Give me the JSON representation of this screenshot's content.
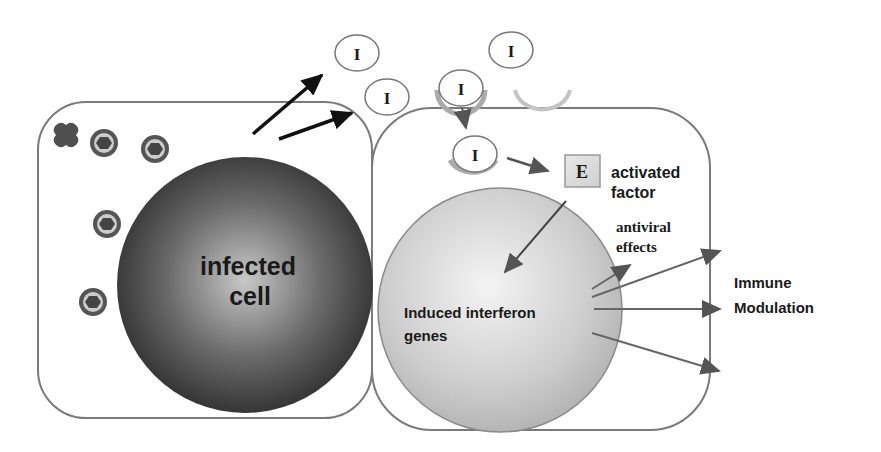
{
  "diagram": {
    "infected_cell": {
      "line1": "infected",
      "line2": "cell"
    },
    "induced_genes": {
      "line1": "Induced interferon",
      "line2": "genes"
    },
    "activated_factor": {
      "symbol": "E",
      "line1": "activated",
      "line2": "factor"
    },
    "antiviral": {
      "line1": "antiviral",
      "line2": "effects"
    },
    "immune": {
      "line1": "Immune",
      "line2": "Modulation"
    },
    "interferon_symbol": "I",
    "interferons": [
      {
        "id": "i1",
        "label": "I"
      },
      {
        "id": "i2",
        "label": "I"
      },
      {
        "id": "i3",
        "label": "I"
      },
      {
        "id": "i4",
        "label": "I"
      },
      {
        "id": "i5",
        "label": "I"
      }
    ],
    "colors": {
      "outline": "#7a7a7a",
      "infected_dark": "#3a3a3a",
      "infected_light": "#bdbdbd",
      "gene_fill": "#cfcfcf",
      "gene_light": "#f2f2f2",
      "arrow_dark": "#111111",
      "arrow_gray": "#6e6e6e",
      "receptor": "#b8b8b8"
    }
  }
}
